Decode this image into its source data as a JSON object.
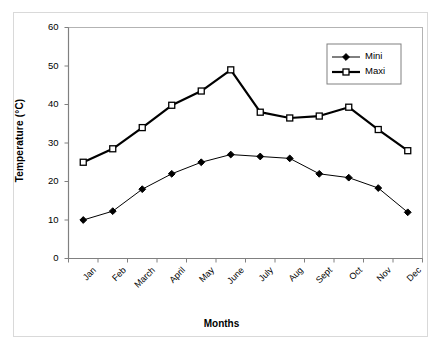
{
  "chart_data": {
    "type": "line",
    "title": "",
    "xlabel": "Months",
    "ylabel": "Temperature (°C)",
    "categories": [
      "Jan",
      "Feb",
      "March",
      "April",
      "May",
      "June",
      "July",
      "Aug",
      "Sept",
      "Oct",
      "Nov",
      "Dec"
    ],
    "series": [
      {
        "name": "Mini",
        "marker": "filled-diamond",
        "line_width": 1,
        "color": "#000000",
        "values": [
          10,
          12.3,
          18,
          22,
          25,
          27,
          26.5,
          26,
          22,
          21,
          18.3,
          12
        ]
      },
      {
        "name": "Maxi",
        "marker": "open-square",
        "line_width": 2.2,
        "color": "#000000",
        "values": [
          25,
          28.5,
          34,
          39.8,
          43.5,
          49,
          38,
          36.5,
          37,
          39.3,
          33.5,
          28
        ]
      }
    ],
    "ylim": [
      0,
      60
    ],
    "yticks": [
      0,
      10,
      20,
      30,
      40,
      50,
      60
    ],
    "ytick_labels": [
      "0",
      "10",
      "20",
      "30",
      "40",
      "50",
      "60"
    ],
    "grid": false,
    "legend_position": "top-right",
    "legend_entries": [
      "Mini",
      "Maxi"
    ]
  },
  "legend": {
    "items": [
      {
        "label": "Mini"
      },
      {
        "label": "Maxi"
      }
    ]
  },
  "axes": {
    "x_title": "Months",
    "y_title": "Temperature (°C)"
  },
  "colors": {
    "line": "#000000",
    "frame": "#808080",
    "outer_frame": "#d9d9d9",
    "background": "#ffffff"
  }
}
